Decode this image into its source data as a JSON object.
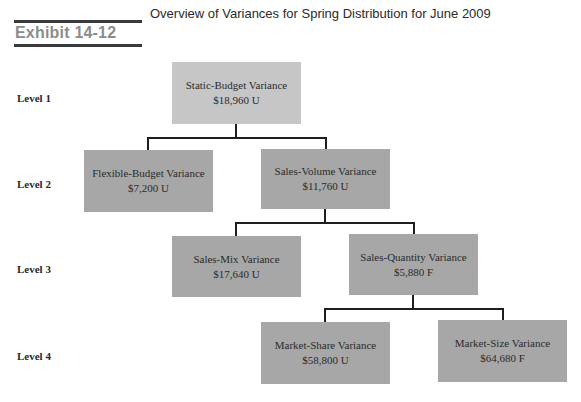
{
  "header": {
    "exhibit_label": "Exhibit 14-12",
    "title": "Overview of Variances for Spring Distribution for June 2009"
  },
  "levels": [
    {
      "label": "Level 1"
    },
    {
      "label": "Level 2"
    },
    {
      "label": "Level 3"
    },
    {
      "label": "Level 4"
    }
  ],
  "nodes": {
    "static_budget": {
      "name": "Static-Budget Variance",
      "value": "$18,960 U"
    },
    "flexible_budget": {
      "name": "Flexible-Budget Variance",
      "value": "$7,200 U"
    },
    "sales_volume": {
      "name": "Sales-Volume Variance",
      "value": "$11,760 U"
    },
    "sales_mix": {
      "name": "Sales-Mix Variance",
      "value": "$17,640 U"
    },
    "sales_quantity": {
      "name": "Sales-Quantity Variance",
      "value": "$5,880 F"
    },
    "market_share": {
      "name": "Market-Share Variance",
      "value": "$58,800 U"
    },
    "market_size": {
      "name": "Market-Size Variance",
      "value": "$64,680 F"
    }
  },
  "colors": {
    "level1_box": "#c6c6c6",
    "box": "#a7a7a7",
    "connector": "#1e1e1e",
    "exhibit_label": "#8c8c8c"
  }
}
